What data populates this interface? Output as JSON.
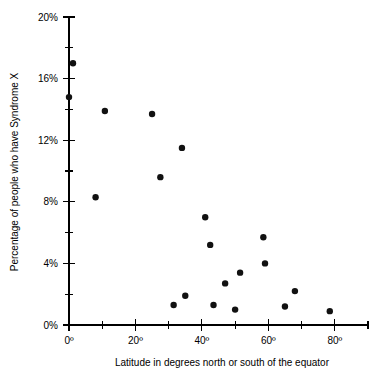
{
  "chart_data": {
    "type": "scatter",
    "title": "",
    "xlabel": "Latitude in degrees north or south of the equator",
    "ylabel": "Percentage of people who have Syndrome X",
    "xlim": [
      0,
      90
    ],
    "ylim": [
      0,
      20
    ],
    "grid": false,
    "legend": null,
    "x_ticks_major": [
      0,
      20,
      40,
      60,
      80
    ],
    "x_tick_labels": [
      "0º",
      "20º",
      "40º",
      "60º",
      "80º"
    ],
    "x_ticks_minor": [
      10,
      30,
      50,
      70,
      90
    ],
    "y_ticks_major": [
      0,
      4,
      8,
      12,
      16,
      20
    ],
    "y_tick_labels": [
      "0%",
      "4%",
      "8%",
      "12%",
      "16%",
      "20%"
    ],
    "y_ticks_minor": [
      2,
      6,
      10,
      14,
      18
    ],
    "marker": "filled-circle",
    "marker_color": "#111111",
    "points": [
      {
        "x": 1.2,
        "y": 17.0
      },
      {
        "x": 0.0,
        "y": 14.8
      },
      {
        "x": 10.8,
        "y": 13.9
      },
      {
        "x": 25.0,
        "y": 13.7
      },
      {
        "x": 27.5,
        "y": 9.6
      },
      {
        "x": 8.0,
        "y": 8.3
      },
      {
        "x": 34.0,
        "y": 11.5
      },
      {
        "x": 41.0,
        "y": 7.0
      },
      {
        "x": 42.5,
        "y": 5.2
      },
      {
        "x": 58.5,
        "y": 5.7
      },
      {
        "x": 59.0,
        "y": 4.0
      },
      {
        "x": 51.5,
        "y": 3.4
      },
      {
        "x": 47.0,
        "y": 2.7
      },
      {
        "x": 68.0,
        "y": 2.2
      },
      {
        "x": 35.0,
        "y": 1.9
      },
      {
        "x": 31.5,
        "y": 1.3
      },
      {
        "x": 43.5,
        "y": 1.3
      },
      {
        "x": 65.0,
        "y": 1.2
      },
      {
        "x": 50.0,
        "y": 1.0
      },
      {
        "x": 78.5,
        "y": 0.9
      }
    ]
  }
}
